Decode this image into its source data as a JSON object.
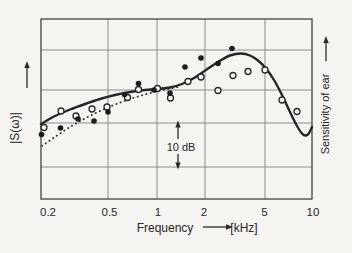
{
  "colors": {
    "background": "#f6f4f1",
    "ink": "#262626",
    "grid": "#8d8d8d"
  },
  "chart_data": {
    "type": "scatter",
    "title": "",
    "grid": true,
    "x_axis": {
      "label": "Frequency",
      "unit": "[kHz]",
      "scale": "log",
      "range_khz": [
        0.2,
        10
      ],
      "ticks": [
        "0.2",
        "0.5",
        "1",
        "2",
        "5",
        "10"
      ]
    },
    "y_axis_left": {
      "label": "|S(ω)|",
      "arrow": "up"
    },
    "y_axis_right": {
      "label": "Sensitivity of ear",
      "arrow": "up"
    },
    "scale_marker": {
      "label": "10 dB"
    },
    "db_reference": "levels relative to the lower gridline of the 10 dB marker",
    "series": [
      {
        "name": "measured-filled",
        "marker": "filled-circle",
        "f_khz": [
          0.19,
          0.25,
          0.32,
          0.4,
          0.49,
          0.63,
          0.77,
          0.96,
          1.21,
          1.49,
          1.89,
          2.4,
          2.94
        ],
        "level_db_rel": [
          7.5,
          9.0,
          11.1,
          10.6,
          12.7,
          16.7,
          19.2,
          17.7,
          17.1,
          23.0,
          25.1,
          23.8,
          27.3
        ]
      },
      {
        "name": "measured-open",
        "marker": "open-circle",
        "f_khz": [
          0.2,
          0.25,
          0.31,
          0.39,
          0.49,
          0.65,
          0.77,
          1.0,
          1.21,
          1.56,
          1.88,
          2.4,
          2.99,
          3.7,
          4.73,
          6.02,
          7.47
        ],
        "level_db_rel": [
          9.1,
          12.9,
          11.8,
          13.4,
          13.8,
          16.0,
          17.9,
          18.0,
          15.9,
          19.7,
          20.7,
          17.7,
          21.1,
          22.0,
          22.4,
          15.4,
          12.7
        ]
      },
      {
        "name": "solid-curve",
        "type": "line",
        "style": "solid",
        "f_khz": [
          0.19,
          0.23,
          0.29,
          0.36,
          0.44,
          0.55,
          0.68,
          0.84,
          1.0,
          1.21,
          1.43,
          1.7,
          2.02,
          2.4,
          2.85,
          3.34,
          3.8,
          4.26,
          4.77,
          5.36,
          6.03,
          6.74,
          7.45,
          8.1,
          8.71,
          9.25
        ],
        "level_db_rel": [
          9.9,
          11.8,
          13.2,
          14.5,
          15.7,
          16.6,
          17.3,
          17.7,
          18.0,
          18.3,
          19.1,
          20.5,
          22.4,
          24.2,
          25.7,
          26.2,
          25.7,
          24.5,
          22.7,
          20.0,
          16.6,
          12.7,
          9.4,
          7.5,
          7.5,
          9.2
        ]
      },
      {
        "name": "dotted-curve",
        "type": "line",
        "style": "dotted",
        "f_khz": [
          0.19,
          0.23,
          0.29,
          0.36,
          0.44,
          0.55,
          0.68,
          0.84,
          1.01,
          1.21,
          1.39
        ],
        "level_db_rel": [
          4.8,
          6.9,
          9.2,
          11.2,
          12.9,
          14.4,
          15.7,
          16.7,
          17.5,
          18.1,
          18.5
        ]
      }
    ]
  },
  "geometry": {
    "frame": {
      "left": 41,
      "top": 19,
      "right": 312,
      "bottom": 199
    },
    "v_gridlines_x": [
      108,
      157,
      205,
      265
    ],
    "h_gridlines_y": [
      50,
      90,
      123,
      167
    ],
    "filled_points": [
      [
        41.5,
        134.5
      ],
      [
        60.5,
        128
      ],
      [
        78,
        119
      ],
      [
        94,
        121
      ],
      [
        108,
        112
      ],
      [
        124.5,
        94.5
      ],
      [
        138.5,
        83.5
      ],
      [
        154,
        90
      ],
      [
        170,
        93
      ],
      [
        185,
        67
      ],
      [
        201,
        58
      ],
      [
        218,
        63.5
      ],
      [
        232,
        48.5
      ]
    ],
    "open_points": [
      [
        44,
        127.5
      ],
      [
        61,
        111
      ],
      [
        76,
        116
      ],
      [
        92,
        109
      ],
      [
        107,
        107
      ],
      [
        127.5,
        97.5
      ],
      [
        138.5,
        89.5
      ],
      [
        157.5,
        88.5
      ],
      [
        170.5,
        98
      ],
      [
        188,
        81.5
      ],
      [
        201,
        77
      ],
      [
        218,
        90.5
      ],
      [
        233,
        75.5
      ],
      [
        248,
        71.5
      ],
      [
        265,
        70
      ],
      [
        282,
        100
      ],
      [
        297,
        111.5
      ]
    ],
    "solid_curve": [
      [
        41,
        124
      ],
      [
        55,
        116
      ],
      [
        70,
        109.5
      ],
      [
        85,
        104
      ],
      [
        100,
        99
      ],
      [
        115,
        95
      ],
      [
        130,
        92
      ],
      [
        145,
        90
      ],
      [
        157,
        89
      ],
      [
        170,
        87.5
      ],
      [
        182,
        84
      ],
      [
        194,
        78
      ],
      [
        206,
        70
      ],
      [
        218,
        62
      ],
      [
        230,
        55.5
      ],
      [
        241,
        53.5
      ],
      [
        250,
        55.5
      ],
      [
        258,
        60.5
      ],
      [
        266,
        68.5
      ],
      [
        274,
        80
      ],
      [
        282,
        95
      ],
      [
        290,
        112
      ],
      [
        297,
        126
      ],
      [
        303,
        134.5
      ],
      [
        308,
        134.5
      ],
      [
        312,
        127
      ]
    ],
    "dotted_curve": [
      [
        42,
        146
      ],
      [
        55,
        137
      ],
      [
        70,
        127
      ],
      [
        85,
        118.5
      ],
      [
        100,
        111
      ],
      [
        115,
        104.5
      ],
      [
        130,
        99
      ],
      [
        145,
        94.5
      ],
      [
        158,
        91
      ],
      [
        170,
        88.5
      ],
      [
        180,
        86.5
      ]
    ],
    "arrows": [
      {
        "name": "y-left-axis-arrow",
        "x1": 27,
        "y1": 88,
        "x2": 27,
        "y2": 66,
        "dir": "up"
      },
      {
        "name": "y-right-axis-arrow",
        "x1": 326,
        "y1": 61,
        "x2": 326,
        "y2": 41,
        "dir": "up"
      },
      {
        "name": "x-axis-arrow",
        "x1": 203,
        "y1": 227,
        "x2": 228,
        "y2": 227,
        "dir": "right"
      },
      {
        "name": "db-marker-arrow-up",
        "x1": 178,
        "y1": 139,
        "x2": 178,
        "y2": 125.5,
        "dir": "up"
      },
      {
        "name": "db-marker-arrow-down",
        "x1": 178,
        "y1": 154,
        "x2": 178,
        "y2": 164.5,
        "dir": "down"
      }
    ]
  }
}
